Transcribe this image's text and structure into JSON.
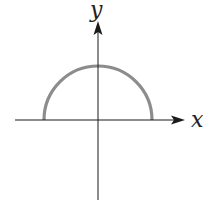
{
  "figure": {
    "x_axis_label": "x",
    "y_axis_label": "y",
    "colors": {
      "axes": "#1a1a1a",
      "curve": "#8c8c8c",
      "background": "#ffffff"
    },
    "geometry": {
      "origin_px": [
        98,
        120
      ],
      "radius_px": 54,
      "x_axis_range_px": [
        15,
        183
      ],
      "y_axis_range_px": [
        22,
        200
      ]
    },
    "curve": {
      "type": "semicircle",
      "half": "upper",
      "equation_hint": "y = sqrt(r^2 - x^2)"
    }
  }
}
